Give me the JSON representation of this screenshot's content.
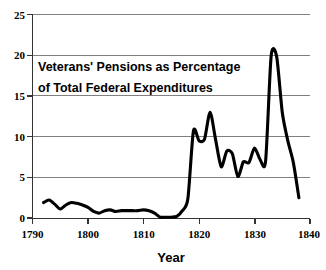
{
  "chart_data": {
    "type": "line",
    "title": "Veterans' Pensions as Percentage of Total Federal Expenditures",
    "title_line1": "Veterans' Pensions as Percentage",
    "title_line2": "of Total Federal Expenditures",
    "xlabel": "Year",
    "ylabel": "",
    "xlim": [
      1790,
      1840
    ],
    "ylim": [
      0,
      25
    ],
    "grid": true,
    "legend": "none",
    "series_color": "#000000",
    "xticks": [
      1790,
      1800,
      1810,
      1820,
      1830,
      1840
    ],
    "xtick_labels": [
      "1790",
      "1800",
      "1810",
      "1820",
      "1830",
      "1840"
    ],
    "yticks": [
      0,
      5,
      10,
      15,
      20,
      25
    ],
    "ytick_labels": [
      "0",
      "5",
      "10",
      "15",
      "20",
      "25"
    ],
    "x": [
      1792,
      1793,
      1794,
      1795,
      1796,
      1797,
      1798,
      1799,
      1800,
      1801,
      1802,
      1803,
      1804,
      1805,
      1806,
      1807,
      1808,
      1809,
      1810,
      1811,
      1812,
      1813,
      1814,
      1815,
      1816,
      1817,
      1818,
      1819,
      1820,
      1821,
      1822,
      1823,
      1824,
      1825,
      1826,
      1827,
      1828,
      1829,
      1830,
      1831,
      1832,
      1833,
      1834,
      1835,
      1836,
      1837,
      1838
    ],
    "values": [
      1.9,
      2.2,
      1.7,
      1.1,
      1.6,
      1.9,
      1.8,
      1.6,
      1.3,
      0.8,
      0.6,
      0.9,
      1.0,
      0.8,
      0.9,
      0.9,
      0.9,
      0.9,
      1.0,
      0.9,
      0.6,
      0.1,
      0.1,
      0.1,
      0.2,
      0.9,
      2.4,
      10.7,
      9.5,
      9.7,
      13.0,
      9.6,
      6.3,
      8.2,
      7.9,
      5.1,
      6.9,
      6.8,
      8.6,
      7.2,
      7.0,
      19.9,
      19.8,
      13.0,
      9.5,
      6.8,
      2.5
    ]
  }
}
